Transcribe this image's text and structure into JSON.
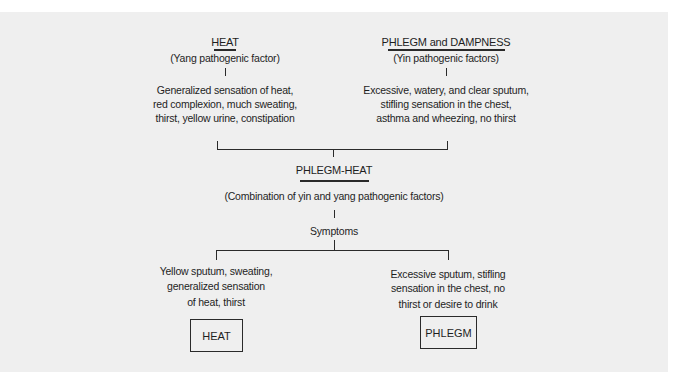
{
  "diagram": {
    "heat": {
      "title": "HEAT",
      "subtitle": "(Yang pathogenic factor)",
      "symptoms": [
        "Generalized sensation of heat,",
        "red complexion, much sweating,",
        "thirst, yellow urine, constipation"
      ]
    },
    "phlegm_dampness": {
      "title": "PHLEGM and DAMPNESS",
      "subtitle": "(Yin pathogenic factors)",
      "symptoms": [
        "Excessive, watery, and clear sputum,",
        "stifling sensation in the chest,",
        "asthma and wheezing, no thirst"
      ]
    },
    "phlegm_heat": {
      "title": "PHLEGM-HEAT",
      "subtitle": "(Combination of yin and yang pathogenic factors)",
      "symptoms_label": "Symptoms"
    },
    "outcome_heat": {
      "symptoms": [
        "Yellow sputum, sweating,",
        "generalized sensation",
        "of heat, thirst"
      ],
      "box_label": "HEAT"
    },
    "outcome_phlegm": {
      "symptoms": [
        "Excessive sputum, stifling",
        "sensation in the chest, no",
        "thirst or desire to drink"
      ],
      "box_label": "PHLEGM"
    },
    "colors": {
      "background": "#efefef",
      "line": "#2a2a2a",
      "text": "#1e1e1e"
    }
  }
}
